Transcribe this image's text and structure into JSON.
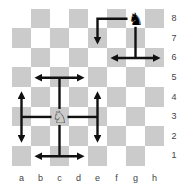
{
  "board": {
    "files": [
      "a",
      "b",
      "c",
      "d",
      "e",
      "f",
      "g",
      "h"
    ],
    "ranks": [
      "8",
      "7",
      "6",
      "5",
      "4",
      "3",
      "2",
      "1"
    ],
    "colors": {
      "light": "#ffffff",
      "dark": "#cbcbcb",
      "border": "#555555",
      "arrow": "#111111"
    }
  },
  "pieces": [
    {
      "square": "g8",
      "type": "knight",
      "color": "black",
      "glyph": "♞"
    },
    {
      "square": "c3",
      "type": "knight",
      "color": "white",
      "glyph": "♘"
    }
  ],
  "arrows": [
    {
      "from": "g8",
      "path": [
        "g8",
        "e8",
        "e7"
      ],
      "shape": "L",
      "heads": [
        "e7"
      ]
    },
    {
      "from": "g8",
      "path": [
        "g8",
        "g6"
      ],
      "bar": [
        "f6",
        "h6"
      ],
      "shape": "T",
      "heads": [
        "f6",
        "h6"
      ]
    },
    {
      "from": "c3",
      "path": [
        "c3",
        "c5"
      ],
      "bar": [
        "b5",
        "d5"
      ],
      "shape": "T",
      "heads": [
        "b5",
        "d5"
      ]
    },
    {
      "from": "c3",
      "path": [
        "c3",
        "c1"
      ],
      "bar": [
        "b1",
        "d1"
      ],
      "shape": "T",
      "heads": [
        "b1",
        "d1"
      ]
    },
    {
      "from": "c3",
      "path": [
        "c3",
        "a3"
      ],
      "bar": [
        "a4",
        "a2"
      ],
      "shape": "T",
      "heads": [
        "a4",
        "a2"
      ]
    },
    {
      "from": "c3",
      "path": [
        "c3",
        "e3"
      ],
      "bar": [
        "e4",
        "e2"
      ],
      "shape": "T",
      "heads": [
        "e4",
        "e2"
      ]
    }
  ]
}
